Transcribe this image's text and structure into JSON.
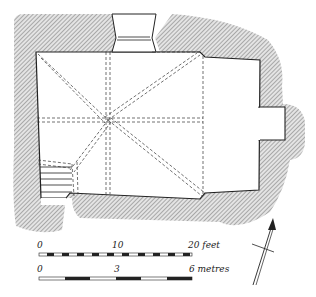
{
  "figure": {
    "type": "architectural-floor-plan",
    "colors": {
      "ink": "#222222",
      "hatch": "#8a8a8a",
      "wall_fill": "#d9d9d9",
      "background": "#ffffff"
    }
  },
  "scale_bars": {
    "feet": {
      "ticks": [
        "0",
        "10",
        "20 feet"
      ]
    },
    "metres": {
      "ticks": [
        "0",
        "3",
        "6 metres"
      ]
    }
  },
  "north_arrow": {
    "icon": "north-arrow-icon"
  }
}
